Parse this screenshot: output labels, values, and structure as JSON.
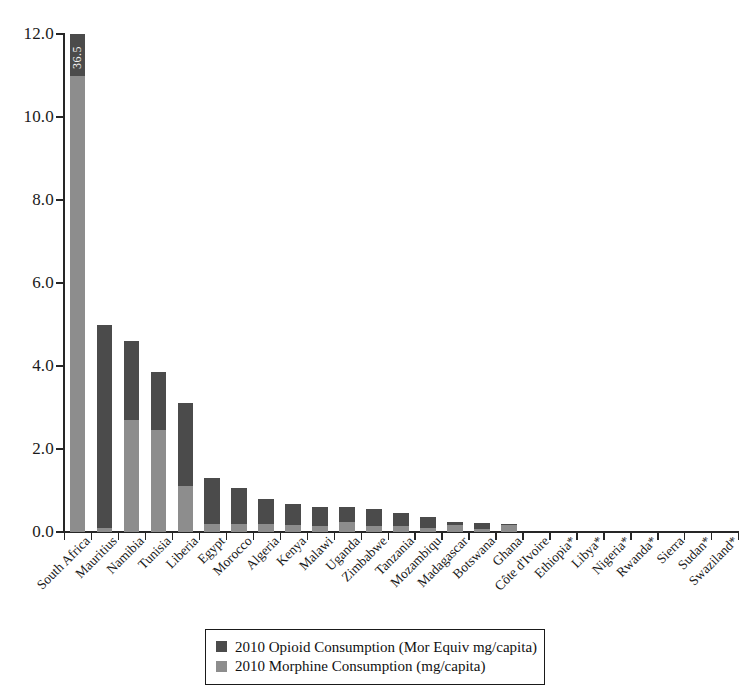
{
  "chart_data": {
    "type": "bar",
    "subtype": "stacked-vertical",
    "title": "",
    "xlabel": "",
    "ylabel": "",
    "ylim": [
      0.0,
      12.0
    ],
    "ytick_labels": [
      "0.0",
      "2.0",
      "4.0",
      "6.0",
      "8.0",
      "10.0",
      "12.0"
    ],
    "ytick_values": [
      0.0,
      2.0,
      4.0,
      6.0,
      8.0,
      10.0,
      12.0
    ],
    "grid": false,
    "legend_position": "bottom-center",
    "clipped_note": "South Africa bar is truncated at the 12.0 axis maximum; its total is annotated in-bar as 36.5",
    "categories": [
      "South Africa",
      "Mauritius",
      "Namibia",
      "Tunisia",
      "Liberia",
      "Egypt",
      "Morocco",
      "Algeria",
      "Kenya",
      "Malawi",
      "Uganda",
      "Zimbabwe",
      "Tanzania",
      "Mozambiqu",
      "Madagascar",
      "Botswana",
      "Ghana",
      "Côte d'Ivoire",
      "Ethiopia*",
      "Libya*",
      "Nigeria*",
      "Rwanda*",
      "Sierra",
      "Sudan*",
      "Swaziland*"
    ],
    "series": [
      {
        "name": "2010 Opioid Consumption (Mor Equiv mg/capita)",
        "color": "#4b4b4b",
        "stack_position": "top",
        "values": [
          25.5,
          4.9,
          1.9,
          1.4,
          2.0,
          1.1,
          0.85,
          0.6,
          0.5,
          0.45,
          0.35,
          0.4,
          0.33,
          0.27,
          0.08,
          0.13,
          0.03,
          0.0,
          0.0,
          0.0,
          0.0,
          0.0,
          0.0,
          0.0,
          0.0
        ]
      },
      {
        "name": "2010 Morphine Consumption (mg/capita)",
        "color": "#8d8d8d",
        "stack_position": "bottom",
        "values": [
          11.0,
          0.1,
          2.7,
          2.45,
          1.1,
          0.2,
          0.2,
          0.2,
          0.18,
          0.15,
          0.25,
          0.15,
          0.14,
          0.1,
          0.17,
          0.08,
          0.17,
          0.0,
          0.0,
          0.0,
          0.0,
          0.0,
          0.0,
          0.0,
          0.0
        ]
      }
    ],
    "totals": [
      36.5,
      5.0,
      4.6,
      3.85,
      3.1,
      1.3,
      1.05,
      0.8,
      0.68,
      0.6,
      0.6,
      0.55,
      0.47,
      0.37,
      0.25,
      0.21,
      0.2,
      0.0,
      0.0,
      0.0,
      0.0,
      0.0,
      0.0,
      0.0,
      0.0
    ],
    "bar_annotations": [
      {
        "category": "South Africa",
        "text": "36.5",
        "rotated": true,
        "inside_bar": true
      }
    ]
  },
  "legend": {
    "items": [
      {
        "label": "2010 Opioid Consumption (Mor Equiv mg/capita)",
        "color": "#4b4b4b"
      },
      {
        "label": "2010 Morphine Consumption (mg/capita)",
        "color": "#8d8d8d"
      }
    ]
  },
  "colors": {
    "opioid_dark": "#4b4b4b",
    "morphine_light": "#8d8d8d",
    "axis": "#262626",
    "background": "#ffffff",
    "text": "#1a1a1a"
  }
}
